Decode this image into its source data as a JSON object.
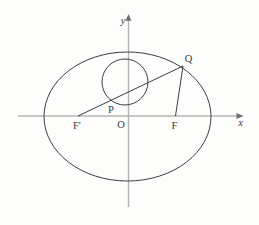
{
  "figure": {
    "colors": {
      "background": "#fdfdfc",
      "curve": "#3d3d3d",
      "axis": "#b3b3b3",
      "arrow": "#6e6e6e",
      "text": "#3a3a3a"
    },
    "labels": {
      "y_axis": "y",
      "x_axis": "x",
      "point_q": "Q",
      "point_p": "P",
      "focus_left": "F′",
      "origin": "O",
      "focus_right": "F"
    },
    "geometry": {
      "x_axis": {
        "x1": 18,
        "y1": 116,
        "x2": 239,
        "y2": 116
      },
      "x_arrow": {
        "points": "243.5,116 236.5,113.1 236.5,118.9"
      },
      "y_axis": {
        "x1": 128.5,
        "y1": 207,
        "x2": 128.5,
        "y2": 19.5
      },
      "y_arrow": {
        "points": "128.5,14 125.6,20.8 131.4,20.8"
      },
      "ellipse": {
        "cx": 127.5,
        "cy": 116.5,
        "rx": 83.5,
        "ry": 64.5
      },
      "circle": {
        "cx": 125,
        "cy": 82,
        "r": 23
      },
      "line_fprime_q": {
        "x1": 78,
        "y1": 116,
        "x2": 183,
        "y2": 66
      },
      "line_q_f": {
        "x1": 183,
        "y1": 66,
        "x2": 175.5,
        "y2": 116
      },
      "label_y": {
        "x": 123,
        "y": 24
      },
      "label_x": {
        "x": 240.5,
        "y": 125.5
      },
      "label_q": {
        "x": 188.5,
        "y": 62
      },
      "label_p": {
        "x": 111,
        "y": 112.5
      },
      "label_fprime": {
        "x": 77,
        "y": 129
      },
      "label_o": {
        "x": 121,
        "y": 128
      },
      "label_f": {
        "x": 174.5,
        "y": 129
      }
    }
  }
}
